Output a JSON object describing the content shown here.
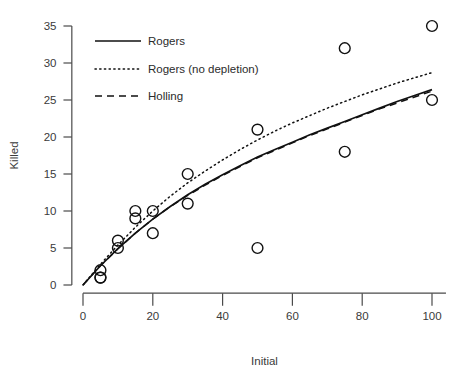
{
  "chart_data": {
    "type": "scatter",
    "title": "",
    "xlabel": "Initial",
    "ylabel": "Killed",
    "xlim": [
      0,
      104
    ],
    "ylim": [
      0,
      36
    ],
    "xticks": [
      0,
      20,
      40,
      60,
      80,
      100
    ],
    "yticks": [
      0,
      5,
      10,
      15,
      20,
      25,
      30,
      35
    ],
    "xtick_labels": [
      "0",
      "20",
      "40",
      "60",
      "80",
      "100"
    ],
    "ytick_labels": [
      "0",
      "5",
      "10",
      "15",
      "20",
      "25",
      "30",
      "35"
    ],
    "grid": false,
    "legend_position": "top-left",
    "points": {
      "name": "Observed",
      "marker": "open-circle",
      "x": [
        5,
        5,
        5,
        10,
        10,
        15,
        15,
        20,
        20,
        30,
        30,
        50,
        50,
        75,
        75,
        100,
        100
      ],
      "y": [
        2,
        1,
        1,
        6,
        5,
        10,
        9,
        10,
        7,
        15,
        11,
        21,
        5,
        32,
        18,
        35,
        25
      ]
    },
    "series": [
      {
        "name": "Rogers",
        "style": "solid",
        "x": [
          0,
          5,
          10,
          15,
          20,
          25,
          30,
          35,
          40,
          45,
          50,
          55,
          60,
          65,
          70,
          75,
          80,
          85,
          90,
          95,
          100
        ],
        "y": [
          0,
          2.6,
          4.9,
          7.0,
          8.9,
          10.6,
          12.2,
          13.6,
          14.9,
          16.1,
          17.3,
          18.3,
          19.3,
          20.3,
          21.2,
          22.1,
          23.0,
          23.9,
          24.8,
          25.6,
          26.4
        ]
      },
      {
        "name": "Rogers (no depletion)",
        "style": "dotted",
        "x": [
          0,
          5,
          10,
          15,
          20,
          25,
          30,
          35,
          40,
          45,
          50,
          55,
          60,
          65,
          70,
          75,
          80,
          85,
          90,
          95,
          100
        ],
        "y": [
          0,
          2.8,
          5.4,
          7.8,
          10.0,
          12.0,
          13.8,
          15.4,
          16.9,
          18.3,
          19.6,
          20.8,
          21.9,
          22.9,
          23.9,
          24.8,
          25.7,
          26.5,
          27.3,
          28.0,
          28.7
        ]
      },
      {
        "name": "Holling",
        "style": "dashed",
        "x": [
          0,
          5,
          10,
          15,
          20,
          25,
          30,
          35,
          40,
          45,
          50,
          55,
          60,
          65,
          70,
          75,
          80,
          85,
          90,
          95,
          100
        ],
        "y": [
          0,
          2.6,
          4.9,
          7.0,
          8.9,
          10.6,
          12.1,
          13.5,
          14.8,
          16.0,
          17.2,
          18.2,
          19.2,
          20.2,
          21.1,
          22.0,
          22.9,
          23.8,
          24.6,
          25.4,
          26.2
        ]
      }
    ],
    "legend": [
      {
        "label": "Rogers",
        "style": "solid"
      },
      {
        "label": "Rogers (no depletion)",
        "style": "dotted"
      },
      {
        "label": "Holling",
        "style": "dashed"
      }
    ]
  }
}
